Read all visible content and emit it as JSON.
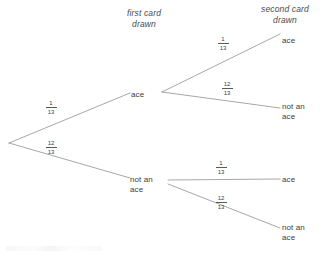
{
  "diagram": {
    "type": "probability-tree",
    "line_color": "#6b6b6b",
    "text_color": "#3d3d3d",
    "background": "#ffffff"
  },
  "headers": {
    "first": "first card\ndrawn",
    "second": "second card\ndrawn"
  },
  "root": {
    "x": 9,
    "y": 143
  },
  "level1": [
    {
      "label": "ace",
      "probability": {
        "numerator": "1",
        "denominator": "13"
      },
      "x": 143,
      "y": 95
    },
    {
      "label": "not an\nace",
      "probability": {
        "numerator": "12",
        "denominator": "13"
      },
      "x": 148,
      "y": 180
    }
  ],
  "level2": [
    {
      "label": "ace",
      "probability": {
        "numerator": "1",
        "denominator": "13"
      },
      "parent": 0,
      "x": 288,
      "y": 41
    },
    {
      "label": "not an\nace",
      "probability": {
        "numerator": "12",
        "denominator": "13"
      },
      "parent": 0,
      "x": 288,
      "y": 108
    },
    {
      "label": "ace",
      "probability": {
        "numerator": "1",
        "denominator": "13"
      },
      "parent": 1,
      "x": 288,
      "y": 180
    },
    {
      "label": "not an\nace",
      "probability": {
        "numerator": "12",
        "denominator": "13"
      },
      "parent": 1,
      "x": 288,
      "y": 230
    }
  ],
  "fraction_positions": {
    "root_upper": {
      "x": 48,
      "y": 103
    },
    "root_lower": {
      "x": 48,
      "y": 143
    },
    "branch_1": {
      "x": 220,
      "y": 39
    },
    "branch_2": {
      "x": 224,
      "y": 84
    },
    "branch_3": {
      "x": 218,
      "y": 163
    },
    "branch_4": {
      "x": 218,
      "y": 198
    }
  }
}
